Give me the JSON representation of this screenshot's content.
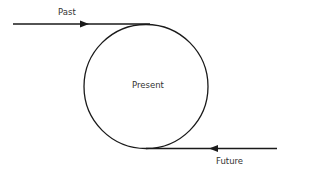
{
  "diagram": {
    "labels": {
      "past": "Past",
      "present": "Present",
      "future": "Future"
    },
    "colors": {
      "stroke": "#1a1a1a",
      "text": "#333333",
      "background": "#ffffff"
    }
  }
}
